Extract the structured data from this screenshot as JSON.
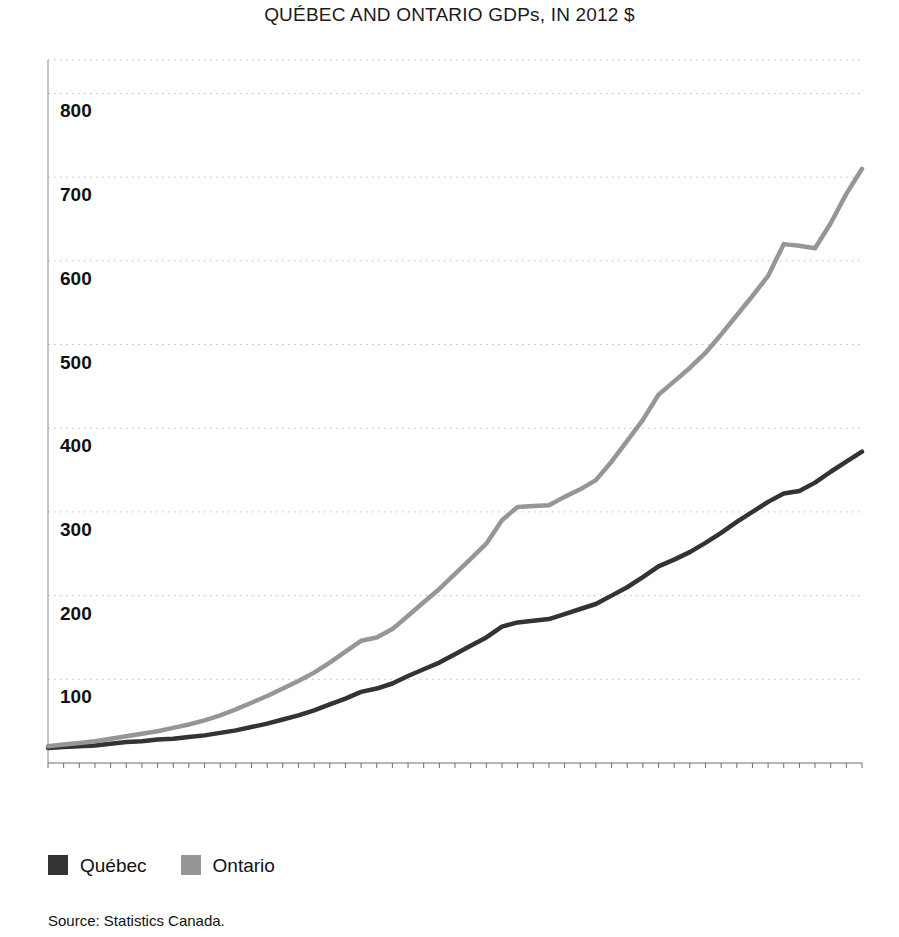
{
  "chart_data": {
    "type": "line",
    "title": "QUÉBEC AND ONTARIO GDPs, IN 2012 $",
    "xlabel": "",
    "ylabel": "",
    "ylim": [
      0,
      840
    ],
    "xlim": [
      1961,
      2013
    ],
    "grid": true,
    "grid_axis": "y",
    "y_ticks": [
      100,
      200,
      300,
      400,
      500,
      600,
      700,
      800
    ],
    "y_tick_labels": [
      "100",
      "200",
      "300",
      "400",
      "500",
      "600",
      "700",
      "800"
    ],
    "x_ticks": [
      1961,
      1966,
      1971,
      1976,
      1981,
      1986,
      1991,
      1996,
      2001,
      2006,
      2011
    ],
    "x_tick_labels": [
      "1961",
      "1966",
      "1971",
      "1976",
      "1981",
      "1986",
      "1991",
      "1996",
      "2001",
      "2006",
      "2011"
    ],
    "x_minor_tick_interval": 1,
    "x_tick_label_rotation": -90,
    "legend_position": "below-left",
    "x": [
      1961,
      1962,
      1963,
      1964,
      1965,
      1966,
      1967,
      1968,
      1969,
      1970,
      1971,
      1972,
      1973,
      1974,
      1975,
      1976,
      1977,
      1978,
      1979,
      1980,
      1981,
      1982,
      1983,
      1984,
      1985,
      1986,
      1987,
      1988,
      1989,
      1990,
      1991,
      1992,
      1993,
      1994,
      1995,
      1996,
      1997,
      1998,
      1999,
      2000,
      2001,
      2002,
      2003,
      2004,
      2005,
      2006,
      2007,
      2008,
      2009,
      2010,
      2011,
      2012,
      2013
    ],
    "series": [
      {
        "name": "Québec",
        "color": "#333333",
        "values": [
          18,
          19,
          20,
          21,
          23,
          25,
          26,
          28,
          29,
          31,
          33,
          36,
          39,
          43,
          47,
          52,
          57,
          63,
          70,
          77,
          85,
          89,
          95,
          104,
          112,
          120,
          130,
          140,
          150,
          163,
          168,
          170,
          172,
          178,
          184,
          190,
          200,
          210,
          222,
          235,
          243,
          252,
          263,
          275,
          288,
          300,
          312,
          322,
          325,
          335,
          348,
          360,
          372
        ]
      },
      {
        "name": "Ontario",
        "color": "#969696",
        "values": [
          20,
          22,
          24,
          26,
          29,
          32,
          35,
          38,
          42,
          46,
          51,
          57,
          64,
          72,
          80,
          89,
          98,
          108,
          120,
          133,
          146,
          150,
          160,
          176,
          192,
          208,
          226,
          244,
          262,
          290,
          306,
          307,
          308,
          318,
          327,
          338,
          360,
          385,
          410,
          440,
          456,
          472,
          490,
          512,
          535,
          558,
          582,
          620,
          618,
          615,
          645,
          680,
          710
        ]
      }
    ],
    "source": "Source: Statistics Canada."
  },
  "legend": {
    "items": [
      {
        "label": "Québec",
        "color": "#333333"
      },
      {
        "label": "Ontario",
        "color": "#969696"
      }
    ]
  }
}
